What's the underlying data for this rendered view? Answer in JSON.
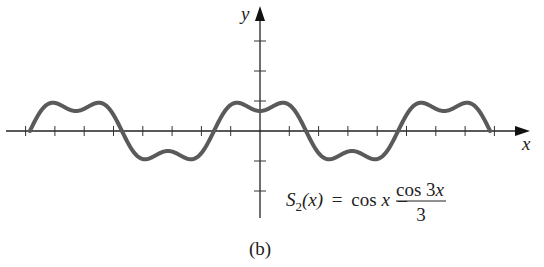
{
  "chart_data": {
    "type": "line",
    "title": "",
    "panel_label": "(b)",
    "xlabel": "x",
    "ylabel": "y",
    "equation": {
      "lhs": "S",
      "lhs_subscript": "2",
      "lhs_arg": "(x)",
      "equals": "=",
      "term1": "cos x",
      "minus": "–",
      "fraction_numerator": "cos 3x",
      "fraction_denominator": "3"
    },
    "function": "cos(x) - cos(3x)/3",
    "xlim": [
      -7.854,
      7.854
    ],
    "ylim": [
      -4,
      4
    ],
    "x_ticks": [
      -8,
      -7,
      -6,
      -5,
      -4,
      -3,
      -2,
      -1,
      1,
      2,
      3,
      4,
      5,
      6,
      7,
      8
    ],
    "y_ticks": [
      -2,
      -1,
      1,
      2,
      3
    ],
    "tick_labels_shown": false,
    "grid": false,
    "legend": null,
    "series": [
      {
        "name": "S2(x)",
        "x": [
          -7.854,
          -7.069,
          -6.283,
          -5.498,
          -4.712,
          -3.927,
          -3.142,
          -2.356,
          -1.571,
          -0.785,
          0,
          0.785,
          1.571,
          2.356,
          3.142,
          3.927,
          4.712,
          5.498,
          6.283,
          7.069,
          7.854
        ],
        "values": [
          0,
          0.943,
          0.667,
          0.943,
          0,
          -0.943,
          -0.667,
          -0.943,
          0,
          0.943,
          0.667,
          0.943,
          0,
          -0.943,
          -0.667,
          -0.943,
          0,
          0.943,
          0.667,
          0.943,
          0
        ]
      }
    ],
    "colors": {
      "curve": "#5a5a5a",
      "axes": "#222222"
    }
  }
}
